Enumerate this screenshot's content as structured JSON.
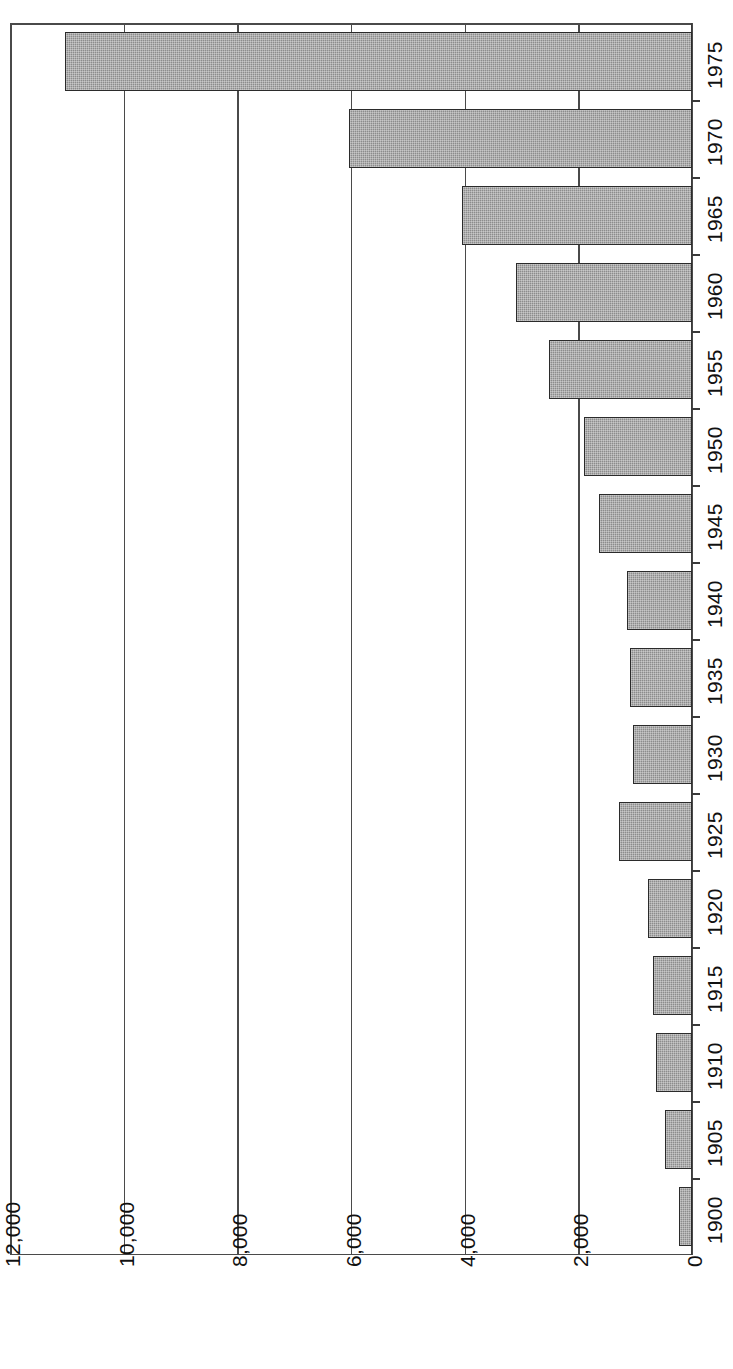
{
  "chart_data": {
    "type": "bar",
    "orientation": "horizontal-rotated",
    "title": "",
    "subtitle": "",
    "xlabel": "",
    "ylabel": "",
    "categories": [
      "1900",
      "1905",
      "1910",
      "1915",
      "1920",
      "1925",
      "1930",
      "1935",
      "1940",
      "1945",
      "1950",
      "1955",
      "1960",
      "1965",
      "1970",
      "1975"
    ],
    "values": [
      230,
      480,
      630,
      690,
      780,
      1290,
      1040,
      1090,
      1150,
      1640,
      1900,
      2520,
      3100,
      4050,
      6040,
      11030
    ],
    "value_axis": {
      "ticks": [
        0,
        2000,
        4000,
        6000,
        8000,
        10000,
        12000
      ],
      "tick_labels": [
        "0",
        "2,000",
        "4,000",
        "6,000",
        "8,000",
        "10,000",
        "12,000"
      ],
      "range": [
        0,
        12000
      ],
      "direction": "right-to-left"
    },
    "category_axis": {
      "position": "right",
      "label_rotation": -90
    },
    "grid": true,
    "legend": false,
    "series": [
      {
        "name": "",
        "values": [
          230,
          480,
          630,
          690,
          780,
          1290,
          1040,
          1090,
          1150,
          1640,
          1900,
          2520,
          3100,
          4050,
          6040,
          11030
        ]
      }
    ],
    "bar_color": "#8c8c8c",
    "bar_border_color": "#2b2b2b",
    "background_color": "#ffffff",
    "axis_color": "#4a4a4a"
  }
}
